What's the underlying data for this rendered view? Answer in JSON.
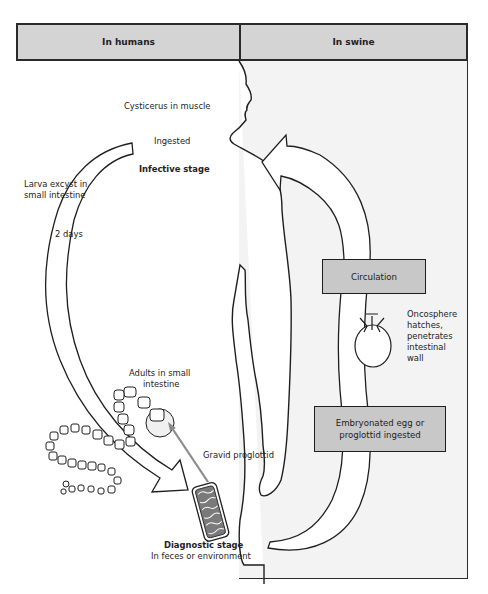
{
  "headers": {
    "humans": "In humans",
    "swine": "In swine"
  },
  "labels": {
    "cysticercus": "Cysticerus in muscle",
    "ingested": "Ingested",
    "infective_stage": "Infective stage",
    "larva_line1": "Larva excyst in",
    "larva_line2": "small intestine",
    "days": "2 days",
    "adults_line1": "Adults in small",
    "adults_line2": "intestine",
    "gravid": "Gravid proglottid",
    "diagnostic_stage": "Diagnostic stage",
    "feces": "In feces or environment",
    "onco_line1": "Oncosphere",
    "onco_line2": "hatches,",
    "onco_line3": "penetrates",
    "onco_line4": "intestinal",
    "onco_line5": "wall"
  },
  "boxes": {
    "circulation": "Circulation",
    "egg_line1": "Embryonated egg or",
    "egg_line2": "proglottid ingested"
  },
  "colors": {
    "header_fill": "#d4d4d4",
    "box_fill": "#c8c8c8",
    "swine_bg": "#f3f3f3",
    "line": "#1e1e1e",
    "pointer": "#8a8a8a"
  }
}
